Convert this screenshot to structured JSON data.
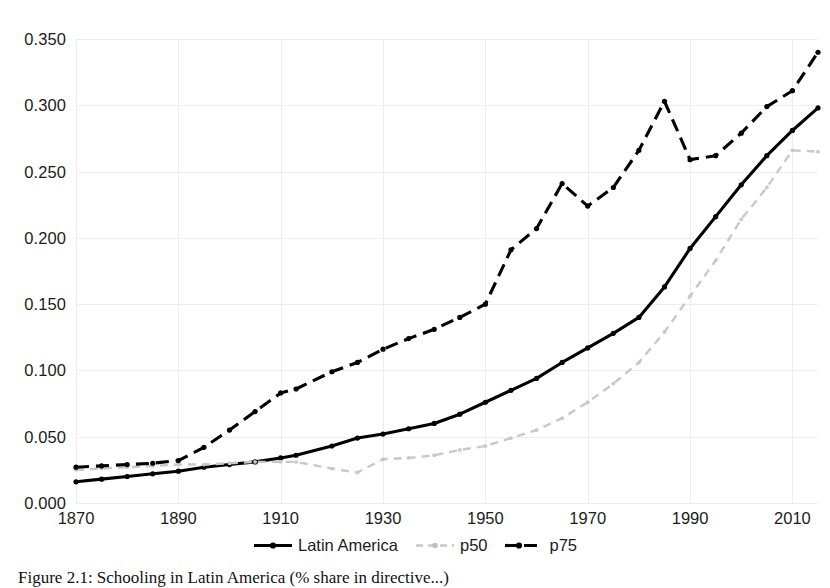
{
  "chart_data": {
    "type": "line",
    "title": "",
    "xlabel": "",
    "ylabel": "",
    "xlim": [
      1870,
      2015
    ],
    "ylim": [
      0.0,
      0.35
    ],
    "grid": true,
    "legend_position": "bottom-center",
    "xticks": [
      "1870",
      "1890",
      "1910",
      "1930",
      "1950",
      "1970",
      "1990",
      "2010"
    ],
    "xtick_values": [
      1870,
      1890,
      1910,
      1930,
      1950,
      1970,
      1990,
      2010
    ],
    "yticks": [
      "0.000",
      "0.050",
      "0.100",
      "0.150",
      "0.200",
      "0.250",
      "0.300",
      "0.350"
    ],
    "ytick_values": [
      0.0,
      0.05,
      0.1,
      0.15,
      0.2,
      0.25,
      0.3,
      0.35
    ],
    "x": [
      1870,
      1875,
      1880,
      1885,
      1890,
      1895,
      1900,
      1905,
      1910,
      1913,
      1920,
      1925,
      1930,
      1935,
      1940,
      1945,
      1950,
      1955,
      1960,
      1965,
      1970,
      1975,
      1980,
      1985,
      1990,
      1995,
      2000,
      2005,
      2010,
      2015
    ],
    "series": [
      {
        "name": "Latin America",
        "color": "#000000",
        "style": "solid",
        "marker": "dot",
        "values": [
          0.016,
          0.018,
          0.02,
          0.022,
          0.024,
          0.027,
          0.029,
          0.031,
          0.034,
          0.036,
          0.043,
          0.049,
          0.052,
          0.056,
          0.06,
          0.067,
          0.076,
          0.085,
          0.094,
          0.106,
          0.117,
          0.128,
          0.14,
          0.163,
          0.192,
          0.216,
          0.24,
          0.262,
          0.281,
          0.298
        ]
      },
      {
        "name": "p50",
        "color": "#c8c8c8",
        "style": "dashed",
        "marker": "dot",
        "values": [
          0.025,
          0.026,
          0.027,
          0.028,
          0.029,
          0.029,
          0.03,
          0.031,
          0.031,
          0.031,
          0.026,
          0.023,
          0.033,
          0.034,
          0.036,
          0.04,
          0.043,
          0.049,
          0.055,
          0.064,
          0.076,
          0.09,
          0.106,
          0.129,
          0.156,
          0.183,
          0.214,
          0.238,
          0.266,
          0.265
        ]
      },
      {
        "name": "p75",
        "color": "#000000",
        "style": "dashed",
        "marker": "dot",
        "values": [
          0.027,
          0.028,
          0.029,
          0.03,
          0.032,
          0.042,
          0.055,
          0.069,
          0.083,
          0.086,
          0.099,
          0.106,
          0.116,
          0.124,
          0.131,
          0.14,
          0.15,
          0.191,
          0.207,
          0.241,
          0.224,
          0.238,
          0.266,
          0.303,
          0.259,
          0.262,
          0.279,
          0.299,
          0.311,
          0.34
        ]
      }
    ]
  },
  "legend": {
    "items": [
      {
        "label": "Latin America",
        "swatch": "solid-black-marker"
      },
      {
        "label": "p50",
        "swatch": "dashed-gray-marker"
      },
      {
        "label": "p75",
        "swatch": "dashed-black-marker"
      }
    ]
  },
  "caption": {
    "text": "Figure 2.1: Schooling in Latin America (% share in directive...)"
  }
}
